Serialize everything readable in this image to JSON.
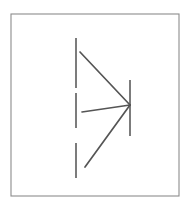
{
  "figure": {
    "canvas": {
      "width": 186,
      "height": 215
    },
    "background_color": "#ffffff",
    "frame": {
      "name": "figure-border",
      "x": 11,
      "y": 14,
      "width": 168,
      "height": 182,
      "stroke_color": "#8c8c8c",
      "stroke_width": 1.1,
      "fill_color": "#ffffff"
    },
    "stroke_color": "#5a5a5a",
    "vertex": {
      "x": 130,
      "y": 105
    },
    "dashed_axis": {
      "name": "dashed-vertical-axis",
      "x": 76,
      "stroke_color": "#6e6e6e",
      "stroke_width": 1.8,
      "segments": [
        {
          "y1": 38,
          "y2": 88
        },
        {
          "y1": 93,
          "y2": 128
        },
        {
          "y1": 143,
          "y2": 178
        }
      ]
    },
    "vertex_bar": {
      "name": "vertex-vertical-bar",
      "x": 130,
      "y1": 80,
      "y2": 136,
      "stroke_color": "#6e6e6e",
      "stroke_width": 1.8
    },
    "rays": [
      {
        "name": "upper-ray",
        "x1": 80,
        "y1": 52,
        "x2": 130,
        "y2": 105,
        "stroke_color": "#555555",
        "stroke_width": 1.7
      },
      {
        "name": "middle-ray",
        "x1": 82,
        "y1": 112,
        "x2": 130,
        "y2": 105,
        "stroke_color": "#555555",
        "stroke_width": 1.7
      },
      {
        "name": "lower-ray",
        "x1": 85,
        "y1": 167,
        "x2": 130,
        "y2": 105,
        "stroke_color": "#555555",
        "stroke_width": 1.7
      }
    ]
  }
}
